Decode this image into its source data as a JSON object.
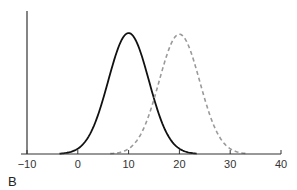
{
  "chart_data": {
    "type": "line",
    "title": "",
    "panel_label": "B",
    "xlabel": "",
    "ylabel": "",
    "xlim": [
      -10,
      40
    ],
    "x_ticks": [
      -10,
      0,
      10,
      20,
      30,
      40
    ],
    "x_tick_labels": [
      "-10",
      "0",
      "10",
      "20",
      "30",
      "40"
    ],
    "y_ticks": [],
    "grid": false,
    "legend": null,
    "series": [
      {
        "name": "distribution 1",
        "kind": "normal",
        "mean": 10,
        "sd_assumed": 4,
        "peak_relative": 1.0,
        "style": "solid",
        "color": "#111111"
      },
      {
        "name": "distribution 2",
        "kind": "normal",
        "mean": 20,
        "sd_assumed": 4,
        "peak_relative": 0.99,
        "style": "dashed",
        "color": "#9a9a9a"
      }
    ]
  }
}
